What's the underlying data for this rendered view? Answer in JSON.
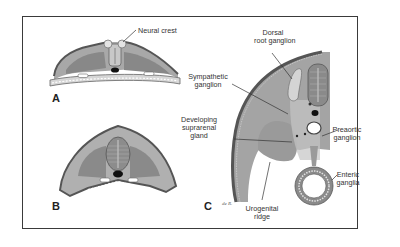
{
  "figure": {
    "panels": [
      {
        "id": "A",
        "label": "A"
      },
      {
        "id": "B",
        "label": "B"
      },
      {
        "id": "C",
        "label": "C"
      }
    ],
    "labels": {
      "neural_crest": "Neural crest",
      "dorsal_root_ganglion_1": "Dorsal",
      "dorsal_root_ganglion_2": "root ganglion",
      "sympathetic_ganglion_1": "Sympathetic",
      "sympathetic_ganglion_2": "ganglion",
      "suprarenal_1": "Developing",
      "suprarenal_2": "suprarenal",
      "suprarenal_3": "gland",
      "preaortic_1": "Preaortic",
      "preaortic_2": "ganglion",
      "enteric_1": "Enteric",
      "enteric_2": "ganglia",
      "urogenital_1": "Urogenital",
      "urogenital_2": "ridge"
    },
    "signature": "de R.",
    "colors": {
      "tissue_dark": "#6e6e6e",
      "tissue_mid": "#9a9a9a",
      "tissue_light": "#c4c4c4",
      "ectoderm": "#5a5a5a",
      "background": "#ffffff",
      "frame": "#3a3a3a"
    }
  }
}
